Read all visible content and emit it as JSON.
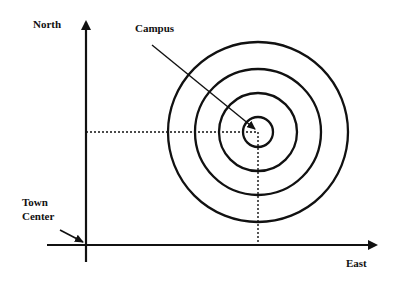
{
  "diagram": {
    "labels": {
      "north": "North",
      "east": "East",
      "campus": "Campus",
      "town_center_line1": "Town",
      "town_center_line2": "Center"
    },
    "colors": {
      "ink": "#111111",
      "background": "#ffffff"
    },
    "axes": {
      "origin": "Town Center",
      "x_axis_direction": "East",
      "y_axis_direction": "North"
    },
    "rings": {
      "count": 4,
      "center_label": "Campus"
    }
  }
}
